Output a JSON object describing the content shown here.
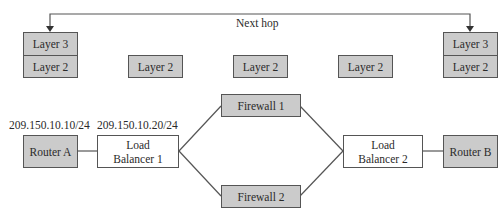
{
  "diagram": {
    "next_hop_label": "Next hop",
    "left_stack": {
      "top": "Layer 3",
      "bottom": "Layer 2"
    },
    "right_stack": {
      "top": "Layer 3",
      "bottom": "Layer 2"
    },
    "middle_layers": [
      "Layer 2",
      "Layer 2",
      "Layer 2"
    ],
    "ip_router_a": "209.150.10.10/24",
    "ip_lb1": "209.150.10.20/24",
    "nodes": {
      "router_a": "Router A",
      "lb1_line1": "Load",
      "lb1_line2": "Balancer 1",
      "firewall1": "Firewall 1",
      "firewall2": "Firewall 2",
      "lb2_line1": "Load",
      "lb2_line2": "Balancer 2",
      "router_b": "Router B"
    },
    "colors": {
      "gray_fill": "#cbcbcb",
      "line": "#555555"
    }
  }
}
